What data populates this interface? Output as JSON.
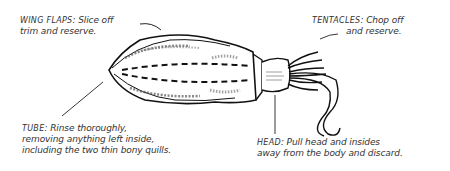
{
  "diagram": {
    "labels": {
      "wing_flaps": {
        "key": "WING FLAPS",
        "line1": ": Slice off",
        "line2": "trim and reserve."
      },
      "tentacles": {
        "key": "TENTACLES",
        "line1": ": Chop off",
        "line2": "and reserve."
      },
      "tube": {
        "key": "TUBE",
        "line1": ": Rinse thoroughly,",
        "line2": "removing anything left inside,",
        "line3": "including the two thin bony quills."
      },
      "head": {
        "key": "HEAD",
        "line1": ": Pull head and insides",
        "line2": "away from the body and discard."
      }
    },
    "colors": {
      "ink": "#111111",
      "text": "#333333",
      "background": "#ffffff"
    }
  }
}
